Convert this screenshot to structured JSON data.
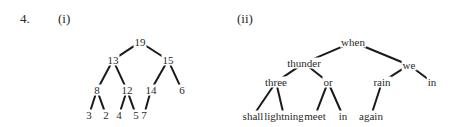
{
  "question_number": "4.",
  "parts": [
    {
      "label": "(i)",
      "tree": {
        "nodes": [
          {
            "id": "n19",
            "text": "19",
            "x": 140,
            "y": 42
          },
          {
            "id": "n13",
            "text": "13",
            "x": 113,
            "y": 60
          },
          {
            "id": "n15",
            "text": "15",
            "x": 168,
            "y": 60
          },
          {
            "id": "n8",
            "text": "8",
            "x": 97,
            "y": 90
          },
          {
            "id": "n12",
            "text": "12",
            "x": 127,
            "y": 90
          },
          {
            "id": "n14",
            "text": "14",
            "x": 151,
            "y": 90
          },
          {
            "id": "n6",
            "text": "6",
            "x": 182,
            "y": 90
          },
          {
            "id": "n3",
            "text": "3",
            "x": 89,
            "y": 115
          },
          {
            "id": "n2",
            "text": "2",
            "x": 106,
            "y": 115
          },
          {
            "id": "n4",
            "text": "4",
            "x": 119,
            "y": 115
          },
          {
            "id": "n5",
            "text": "5",
            "x": 136,
            "y": 115
          },
          {
            "id": "n7",
            "text": "7",
            "x": 144,
            "y": 115
          }
        ],
        "edges": [
          [
            "n19",
            "n13"
          ],
          [
            "n19",
            "n15"
          ],
          [
            "n13",
            "n8"
          ],
          [
            "n13",
            "n12"
          ],
          [
            "n15",
            "n14"
          ],
          [
            "n15",
            "n6"
          ],
          [
            "n8",
            "n3"
          ],
          [
            "n8",
            "n2"
          ],
          [
            "n12",
            "n4"
          ],
          [
            "n12",
            "n5"
          ],
          [
            "n14",
            "n7"
          ]
        ]
      }
    },
    {
      "label": "(ii)",
      "tree": {
        "nodes": [
          {
            "id": "when",
            "text": "when",
            "x": 353,
            "y": 42
          },
          {
            "id": "thunder",
            "text": "thunder",
            "x": 304,
            "y": 63
          },
          {
            "id": "we",
            "text": "we",
            "x": 409,
            "y": 65
          },
          {
            "id": "three",
            "text": "three",
            "x": 276,
            "y": 82
          },
          {
            "id": "or",
            "text": "or",
            "x": 328,
            "y": 82
          },
          {
            "id": "rain",
            "text": "rain",
            "x": 382,
            "y": 82
          },
          {
            "id": "in1",
            "text": "in",
            "x": 432,
            "y": 82
          },
          {
            "id": "shall",
            "text": "shall",
            "x": 253,
            "y": 116
          },
          {
            "id": "lightning",
            "text": "lightning",
            "x": 284,
            "y": 116
          },
          {
            "id": "meet",
            "text": "meet",
            "x": 315,
            "y": 116
          },
          {
            "id": "in2",
            "text": "in",
            "x": 343,
            "y": 116
          },
          {
            "id": "again",
            "text": "again",
            "x": 371,
            "y": 116
          }
        ],
        "edges": [
          [
            "when",
            "thunder"
          ],
          [
            "when",
            "we"
          ],
          [
            "thunder",
            "three"
          ],
          [
            "thunder",
            "or"
          ],
          [
            "we",
            "rain"
          ],
          [
            "we",
            "in1"
          ],
          [
            "three",
            "shall"
          ],
          [
            "three",
            "lightning"
          ],
          [
            "or",
            "meet"
          ],
          [
            "or",
            "in2"
          ],
          [
            "rain",
            "again"
          ]
        ]
      }
    }
  ]
}
